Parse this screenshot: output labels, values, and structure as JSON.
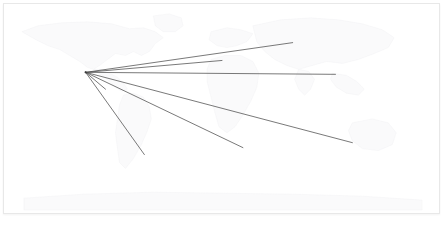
{
  "view": {
    "width": 445,
    "height": 228,
    "background_color": "#ffffff",
    "frame_border_color": "#e8e8e8",
    "title": ""
  },
  "map": {
    "name": "world-basemap",
    "projection": "equirectangular",
    "land_stroke_color": "#efeff1",
    "land_fill_color": "#fafafb",
    "viewbox": "0 0 437 211",
    "regions": [
      {
        "name": "north-america",
        "path": "M 18 28 L 34 22 L 58 19 L 84 18 L 108 20 L 126 25 L 140 24 L 152 28 L 160 34 L 152 40 L 146 48 L 138 52 L 130 48 L 122 52 L 112 50 L 104 56 L 96 62 L 90 66 L 84 64 L 76 58 L 66 52 L 56 46 L 44 42 L 32 36 Z"
      },
      {
        "name": "central-america",
        "path": "M 90 66 L 98 72 L 106 78 L 112 84 L 118 88 L 124 86 L 120 80 L 114 74 L 106 70 L 98 66 Z"
      },
      {
        "name": "greenland",
        "path": "M 150 12 L 166 10 L 178 14 L 180 22 L 172 28 L 160 28 L 152 22 Z"
      },
      {
        "name": "south-america",
        "path": "M 120 92 L 130 90 L 140 94 L 146 104 L 148 116 L 144 128 L 138 142 L 130 156 L 122 166 L 116 160 L 114 146 L 112 130 L 114 116 L 116 102 Z"
      },
      {
        "name": "europe",
        "path": "M 208 28 L 224 24 L 238 26 L 250 30 L 244 38 L 234 42 L 224 44 L 214 42 L 206 36 Z"
      },
      {
        "name": "africa",
        "path": "M 208 56 L 222 52 L 238 52 L 250 58 L 256 70 L 254 84 L 248 98 L 240 112 L 232 124 L 224 130 L 216 124 L 212 110 L 208 94 L 204 78 L 204 66 Z"
      },
      {
        "name": "asia",
        "path": "M 250 22 L 278 16 L 308 14 L 336 16 L 360 20 L 380 26 L 392 34 L 386 44 L 372 50 L 356 56 L 340 60 L 324 58 L 310 62 L 296 66 L 284 62 L 272 56 L 262 48 L 254 38 Z"
      },
      {
        "name": "india",
        "path": "M 296 66 L 306 68 L 312 76 L 308 86 L 302 92 L 296 86 L 292 76 Z"
      },
      {
        "name": "southeast-asia",
        "path": "M 330 70 L 344 72 L 354 78 L 362 86 L 356 92 L 344 90 L 334 84 L 328 76 Z"
      },
      {
        "name": "australia",
        "path": "M 350 120 L 370 116 L 386 120 L 394 130 L 390 142 L 376 148 L 360 146 L 350 138 L 346 128 Z"
      },
      {
        "name": "antarctica",
        "path": "M 20 196 L 80 192 L 150 190 L 220 191 L 290 192 L 360 194 L 420 198 L 420 208 L 20 208 Z"
      }
    ]
  },
  "routes": {
    "name": "flight-routes",
    "stroke_color": "#4a4a4a",
    "stroke_width": 0.75,
    "hub": {
      "label": "",
      "x": 82,
      "y": 69
    },
    "lines": [
      {
        "id": "route-1",
        "label": "",
        "x1": 82,
        "y1": 69,
        "x2": 290,
        "y2": 39,
        "length_px": 210
      },
      {
        "id": "route-2",
        "label": "",
        "x1": 82,
        "y1": 69,
        "x2": 219,
        "y2": 57,
        "length_px": 138
      },
      {
        "id": "route-3",
        "label": "",
        "x1": 82,
        "y1": 69,
        "x2": 333,
        "y2": 71,
        "length_px": 251
      },
      {
        "id": "route-4",
        "label": "",
        "x1": 82,
        "y1": 69,
        "x2": 350,
        "y2": 140,
        "length_px": 277
      },
      {
        "id": "route-5",
        "label": "",
        "x1": 82,
        "y1": 69,
        "x2": 240,
        "y2": 145,
        "length_px": 175
      },
      {
        "id": "route-6",
        "label": "",
        "x1": 82,
        "y1": 69,
        "x2": 141,
        "y2": 152,
        "length_px": 102
      },
      {
        "id": "route-7",
        "label": "",
        "x1": 82,
        "y1": 69,
        "x2": 102,
        "y2": 86,
        "length_px": 26
      }
    ]
  }
}
